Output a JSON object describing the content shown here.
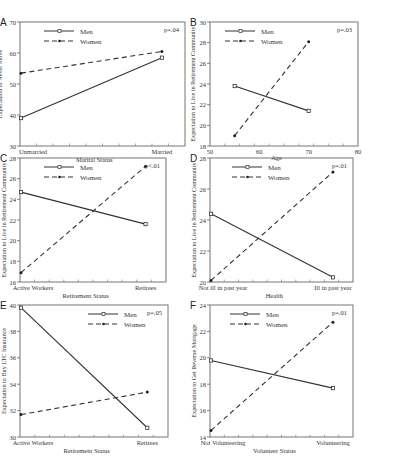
{
  "figure": {
    "panels_count": 6
  },
  "chart_data": [
    {
      "panel": "A",
      "type": "line",
      "categories": [
        "Unmarried",
        "Married"
      ],
      "x_numeric": null,
      "xlabel": "Marital Status",
      "ylabel": "Expectation to Never Move",
      "ylim": [
        30,
        70
      ],
      "yticks": [
        30,
        40,
        50,
        60,
        70
      ],
      "legend": [
        "Men",
        "Women"
      ],
      "legend_position": "top-left",
      "annotation": "p=.04",
      "series": [
        {
          "name": "Men",
          "style": "solid",
          "values": [
            39,
            58.5
          ]
        },
        {
          "name": "Women",
          "style": "dashed",
          "values": [
            53.5,
            60.5
          ]
        }
      ]
    },
    {
      "panel": "B",
      "type": "line",
      "x": [
        55,
        70
      ],
      "xlabel": "Age",
      "xlim": [
        50,
        80
      ],
      "xticks": [
        50,
        60,
        70,
        80
      ],
      "ylabel": "Expectation to Live in Retirement Community",
      "ylim": [
        18,
        30
      ],
      "yticks": [
        18,
        20,
        22,
        24,
        26,
        28,
        30
      ],
      "legend": [
        "Men",
        "Women"
      ],
      "legend_position": "top-left",
      "annotation": "p=.03",
      "series": [
        {
          "name": "Men",
          "style": "solid",
          "values": [
            23.8,
            21.4
          ]
        },
        {
          "name": "Women",
          "style": "dashed",
          "values": [
            19,
            28.1
          ]
        }
      ]
    },
    {
      "panel": "C",
      "type": "line",
      "categories": [
        "Active Workers",
        "Retirees"
      ],
      "xlabel": "Retirement Status",
      "ylabel": "Expectation to Live in Retirement Community",
      "ylim": [
        16,
        28
      ],
      "yticks": [
        16,
        18,
        20,
        22,
        24,
        26,
        28
      ],
      "legend": [
        "Men",
        "Women"
      ],
      "legend_position": "top-left",
      "annotation": "p<.01",
      "series": [
        {
          "name": "Men",
          "style": "solid",
          "values": [
            24.7,
            21.6
          ]
        },
        {
          "name": "Women",
          "style": "dashed",
          "values": [
            16.9,
            27.2
          ]
        }
      ]
    },
    {
      "panel": "D",
      "type": "line",
      "categories": [
        "Not ill in past year",
        "Ill in past year"
      ],
      "xlabel": "Health",
      "ylabel": "Expectation to Live in Retirement Community",
      "ylim": [
        20,
        28
      ],
      "yticks": [
        20,
        22,
        24,
        26,
        28
      ],
      "legend": [
        "Men",
        "Women"
      ],
      "legend_position": "top-left",
      "annotation": "p=.01",
      "series": [
        {
          "name": "Men",
          "style": "solid",
          "values": [
            24.4,
            20.3
          ]
        },
        {
          "name": "Women",
          "style": "dashed",
          "values": [
            20.1,
            27.1
          ]
        }
      ]
    },
    {
      "panel": "E",
      "type": "line",
      "categories": [
        "Active Workers",
        "Retirees"
      ],
      "xlabel": "Retirement Status",
      "ylabel": "Expectation to Buy LTC Insurance",
      "ylim": [
        30,
        40
      ],
      "yticks": [
        30,
        32,
        34,
        36,
        38,
        40
      ],
      "legend": [
        "Men",
        "Women"
      ],
      "legend_position": "top-center",
      "annotation": "p=.05",
      "series": [
        {
          "name": "Men",
          "style": "solid",
          "values": [
            39.8,
            30.7
          ]
        },
        {
          "name": "Women",
          "style": "dashed",
          "values": [
            31.7,
            33.4
          ]
        }
      ]
    },
    {
      "panel": "F",
      "type": "line",
      "categories": [
        "Not Volunteering",
        "Volunteering"
      ],
      "xlabel": "Volunteer Status",
      "ylabel": "Expectation to Get Reverse Mortgage",
      "ylim": [
        14,
        24
      ],
      "yticks": [
        14,
        16,
        18,
        20,
        22,
        24
      ],
      "legend": [
        "Men",
        "Women"
      ],
      "legend_position": "top-left",
      "annotation": "p=.01",
      "series": [
        {
          "name": "Men",
          "style": "solid",
          "values": [
            19.8,
            17.7
          ]
        },
        {
          "name": "Women",
          "style": "dashed",
          "values": [
            14.5,
            22.7
          ]
        }
      ]
    }
  ],
  "layout": [
    {
      "x": 20,
      "y": 22,
      "pw": 165,
      "ph": 124,
      "left": 28,
      "lx": 10,
      "legend_x": 50,
      "ann_dx": 0
    },
    {
      "x": 210,
      "y": 22,
      "pw": 148,
      "ph": 124,
      "left": 27,
      "lx": 12,
      "legend_x": 40,
      "ann_dx": 0
    },
    {
      "x": 20,
      "y": 158,
      "pw": 146,
      "ph": 124,
      "left": 22,
      "lx": 8,
      "legend_x": 44,
      "ann_dx": 0
    },
    {
      "x": 210,
      "y": 158,
      "pw": 143,
      "ph": 124,
      "left": 22,
      "lx": 8,
      "legend_x": 42,
      "ann_dx": 0
    },
    {
      "x": 20,
      "y": 305,
      "pw": 148,
      "ph": 132,
      "left": 22,
      "lx": 8,
      "legend_x": 88,
      "ann_dx": 0
    },
    {
      "x": 210,
      "y": 305,
      "pw": 143,
      "ph": 132,
      "left": 22,
      "lx": 8,
      "legend_x": 40,
      "ann_dx": 0
    }
  ]
}
